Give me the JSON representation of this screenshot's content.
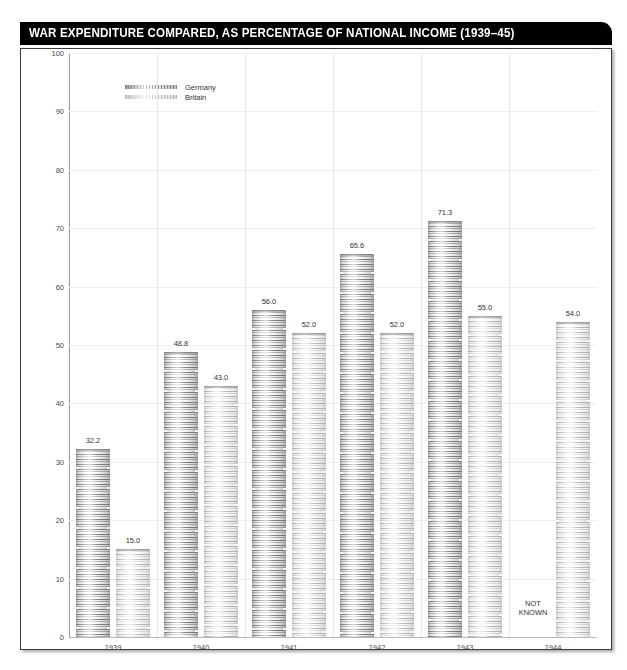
{
  "title": "WAR EXPENDITURE COMPARED, AS PERCENTAGE OF NATIONAL INCOME (1939–45)",
  "legend": {
    "items": [
      {
        "label": "Germany",
        "swatch": "germany-swatch"
      },
      {
        "label": "Britain",
        "swatch": "britain-swatch"
      }
    ]
  },
  "not_known_label": "NOT\nKNOWN",
  "chart_data": {
    "type": "bar",
    "title": "WAR EXPENDITURE COMPARED, AS PERCENTAGE OF NATIONAL INCOME (1939–45)",
    "xlabel": "",
    "ylabel": "",
    "ylim": [
      0,
      100
    ],
    "yticks": [
      0,
      10,
      20,
      30,
      40,
      50,
      60,
      70,
      80,
      90,
      100
    ],
    "ytick_labels": [
      "0",
      "10",
      "20",
      "30",
      "40",
      "50",
      "60",
      "70",
      "80",
      "90",
      "100"
    ],
    "grid": true,
    "legend_position": "upper-left",
    "categories": [
      "1939",
      "1940",
      "1941",
      "1942",
      "1943",
      "1944"
    ],
    "series": [
      {
        "name": "Germany",
        "values": [
          32.2,
          48.8,
          56.0,
          65.6,
          71.3,
          null
        ],
        "labels": [
          "32.2",
          "48.8",
          "56.0",
          "65.6",
          "71.3",
          "NOT KNOWN"
        ]
      },
      {
        "name": "Britain",
        "values": [
          15.0,
          43.0,
          52.0,
          52.0,
          55.0,
          54.0
        ],
        "labels": [
          "15.0",
          "43.0",
          "52.0",
          "52.0",
          "55.0",
          "54.0"
        ]
      }
    ],
    "annotations": [
      {
        "category": "1944",
        "series": "Germany",
        "text": "NOT KNOWN"
      }
    ]
  },
  "colors": {
    "banner_background": "#000000",
    "banner_text": "#ffffff",
    "panel_border": "#3c3c3c",
    "gridline": "#eeeeee",
    "axis": "#9a9a9a",
    "tick_text": "#4a4a4a",
    "value_text": "#333333"
  }
}
